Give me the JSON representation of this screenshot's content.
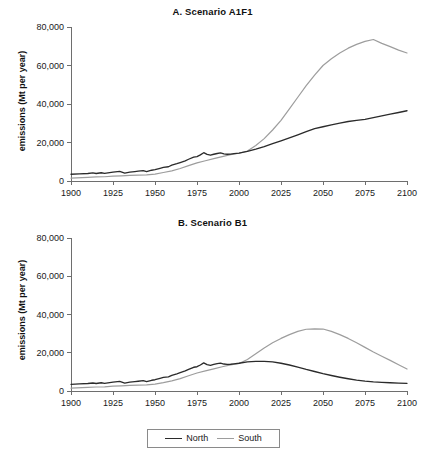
{
  "figure": {
    "ylabel": "emissions (Mt per year)",
    "legend": {
      "position": "bottom-center",
      "entries": [
        {
          "label": "North",
          "color": "#2b2b2b"
        },
        {
          "label": "South",
          "color": "#9d9d9d"
        }
      ]
    }
  },
  "chart_data": [
    {
      "type": "line",
      "title": "A. Scenario A1F1",
      "xlabel": "",
      "ylabel": "emissions (Mt per year)",
      "xlim": [
        1900,
        2100
      ],
      "ylim": [
        0,
        80000
      ],
      "xticks": [
        1900,
        1925,
        1950,
        1975,
        2000,
        2025,
        2050,
        2075,
        2100
      ],
      "xticklabels": [
        "1900",
        "1925",
        "1950",
        "1975",
        "2000",
        "2025",
        "2050",
        "2075",
        "2100"
      ],
      "yticks": [
        0,
        20000,
        40000,
        60000,
        80000
      ],
      "yticklabels": [
        "0",
        "20,000",
        "40,000",
        "60,000",
        "80,000"
      ],
      "grid": false,
      "legend_position": "figure-bottom-center",
      "series": [
        {
          "name": "North",
          "color": "#2b2b2b",
          "x": [
            1900,
            1905,
            1910,
            1913,
            1915,
            1918,
            1920,
            1925,
            1929,
            1932,
            1935,
            1938,
            1940,
            1943,
            1945,
            1948,
            1950,
            1953,
            1955,
            1958,
            1960,
            1963,
            1965,
            1968,
            1970,
            1973,
            1975,
            1977,
            1979,
            1981,
            1983,
            1985,
            1987,
            1989,
            1991,
            1993,
            1995,
            1997,
            2000,
            2005,
            2010,
            2015,
            2020,
            2025,
            2030,
            2035,
            2040,
            2045,
            2050,
            2055,
            2060,
            2065,
            2070,
            2075,
            2080,
            2085,
            2090,
            2095,
            2100
          ],
          "values": [
            3500,
            3700,
            3900,
            4200,
            3900,
            4300,
            4000,
            4600,
            5000,
            4100,
            4600,
            4900,
            5100,
            5400,
            4900,
            5600,
            5900,
            6600,
            7100,
            7400,
            8200,
            9000,
            9600,
            10500,
            11300,
            12400,
            12700,
            13600,
            14700,
            13800,
            13400,
            13900,
            14300,
            14600,
            14100,
            13900,
            14000,
            14200,
            14500,
            15400,
            16600,
            17900,
            19400,
            20900,
            22400,
            24000,
            25600,
            27200,
            28200,
            29200,
            30100,
            30900,
            31500,
            32000,
            32900,
            33800,
            34700,
            35600,
            36500
          ]
        },
        {
          "name": "South",
          "color": "#9d9d9d",
          "x": [
            1900,
            1910,
            1915,
            1920,
            1925,
            1930,
            1935,
            1940,
            1945,
            1950,
            1955,
            1960,
            1965,
            1970,
            1975,
            1980,
            1985,
            1990,
            1995,
            2000,
            2005,
            2010,
            2015,
            2020,
            2025,
            2030,
            2035,
            2040,
            2045,
            2050,
            2055,
            2060,
            2065,
            2070,
            2075,
            2080,
            2085,
            2090,
            2095,
            2100
          ],
          "values": [
            1500,
            1900,
            2100,
            2200,
            2500,
            2700,
            2900,
            3100,
            3200,
            3600,
            4400,
            5300,
            6500,
            8000,
            9400,
            10500,
            11600,
            12700,
            13700,
            14400,
            15600,
            18400,
            22000,
            26500,
            31500,
            37500,
            43500,
            49500,
            55000,
            60000,
            63500,
            66500,
            69000,
            71000,
            72500,
            73500,
            71500,
            69800,
            68000,
            66500
          ]
        }
      ]
    },
    {
      "type": "line",
      "title": "B. Scenario B1",
      "xlabel": "",
      "ylabel": "emissions (Mt per year)",
      "xlim": [
        1900,
        2100
      ],
      "ylim": [
        0,
        80000
      ],
      "xticks": [
        1900,
        1925,
        1950,
        1975,
        2000,
        2025,
        2050,
        2075,
        2100
      ],
      "xticklabels": [
        "1900",
        "1925",
        "1950",
        "1975",
        "2000",
        "2025",
        "2050",
        "2075",
        "2100"
      ],
      "yticks": [
        0,
        20000,
        40000,
        60000,
        80000
      ],
      "yticklabels": [
        "0",
        "20,000",
        "40,000",
        "60,000",
        "80,000"
      ],
      "grid": false,
      "legend_position": "figure-bottom-center",
      "series": [
        {
          "name": "North",
          "color": "#2b2b2b",
          "x": [
            1900,
            1905,
            1910,
            1913,
            1915,
            1918,
            1920,
            1925,
            1929,
            1932,
            1935,
            1938,
            1940,
            1943,
            1945,
            1948,
            1950,
            1953,
            1955,
            1958,
            1960,
            1963,
            1965,
            1968,
            1970,
            1973,
            1975,
            1977,
            1979,
            1981,
            1983,
            1985,
            1987,
            1989,
            1991,
            1993,
            1995,
            1997,
            2000,
            2005,
            2010,
            2015,
            2020,
            2025,
            2030,
            2035,
            2040,
            2045,
            2050,
            2055,
            2060,
            2065,
            2070,
            2075,
            2080,
            2085,
            2090,
            2095,
            2100
          ],
          "values": [
            3500,
            3700,
            3900,
            4200,
            3900,
            4300,
            4000,
            4600,
            5000,
            4100,
            4600,
            4900,
            5100,
            5400,
            4900,
            5600,
            5900,
            6600,
            7100,
            7400,
            8200,
            9000,
            9600,
            10500,
            11300,
            12400,
            12700,
            13600,
            14700,
            13800,
            13400,
            13900,
            14300,
            14600,
            14100,
            13900,
            14000,
            14200,
            14500,
            15200,
            15500,
            15500,
            15200,
            14500,
            13600,
            12500,
            11300,
            10200,
            9100,
            8100,
            7200,
            6400,
            5700,
            5200,
            4800,
            4500,
            4300,
            4150,
            4000
          ]
        },
        {
          "name": "South",
          "color": "#9d9d9d",
          "x": [
            1900,
            1910,
            1915,
            1920,
            1925,
            1930,
            1935,
            1940,
            1945,
            1950,
            1955,
            1960,
            1965,
            1970,
            1975,
            1980,
            1985,
            1990,
            1995,
            2000,
            2005,
            2010,
            2015,
            2020,
            2025,
            2030,
            2035,
            2040,
            2045,
            2050,
            2055,
            2060,
            2065,
            2070,
            2075,
            2080,
            2085,
            2090,
            2095,
            2100
          ],
          "values": [
            1500,
            1900,
            2100,
            2200,
            2500,
            2700,
            2900,
            3100,
            3200,
            3600,
            4400,
            5300,
            6500,
            8000,
            9400,
            10500,
            11600,
            12700,
            13700,
            14400,
            16500,
            19500,
            22500,
            25200,
            27500,
            29500,
            31200,
            32300,
            32500,
            32400,
            31200,
            29500,
            27500,
            25200,
            22800,
            20400,
            18200,
            16000,
            13700,
            11500
          ]
        }
      ]
    }
  ]
}
